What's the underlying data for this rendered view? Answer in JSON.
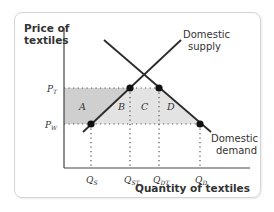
{
  "diagram": {
    "y_axis_title": [
      "Price of",
      "textiles"
    ],
    "x_axis_title": "Quantity of textiles",
    "curves": {
      "supply": {
        "label": [
          "Domestic",
          "supply"
        ]
      },
      "demand": {
        "label": [
          "Domestic",
          "demand"
        ]
      }
    },
    "price_labels": {
      "tariff": {
        "main": "P",
        "sub": "T"
      },
      "world": {
        "main": "P",
        "sub": "W"
      }
    },
    "quantity_labels": [
      {
        "main": "Q",
        "sub": "S"
      },
      {
        "main": "Q",
        "sub": "ST"
      },
      {
        "main": "Q",
        "sub": "DT"
      },
      {
        "main": "Q",
        "sub": "D"
      }
    ],
    "areas": [
      "A",
      "B",
      "C",
      "D"
    ],
    "colors": {
      "line": "#2b2b2b",
      "shade_dark": "#d0d0d0",
      "shade_light": "#e4e4e4",
      "text": "#333333"
    }
  }
}
